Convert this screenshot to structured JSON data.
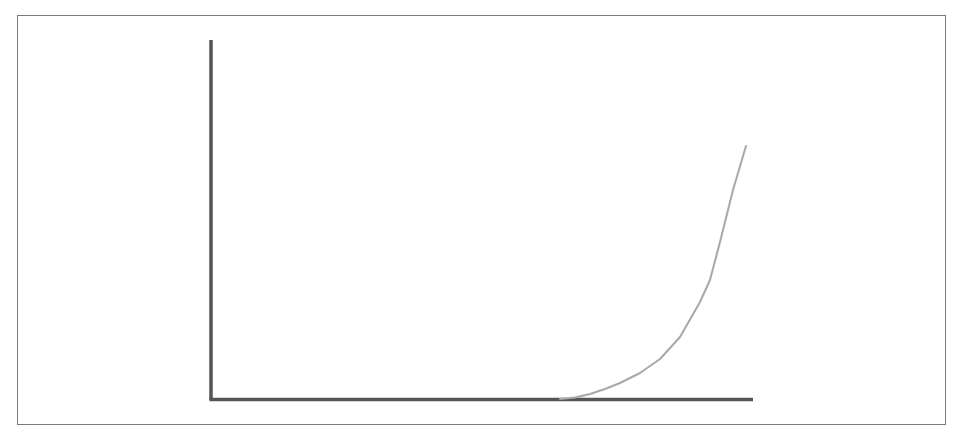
{
  "figure": {
    "colors": {
      "frame": "#7a7a7a",
      "axes": "#555555",
      "curve": "#a8a8a8",
      "background": "#ffffff"
    }
  },
  "axes": {
    "origin": [
      211,
      400
    ],
    "y_axis_top": [
      211,
      40
    ],
    "x_axis_end": [
      753,
      400
    ],
    "x_label": "",
    "y_label": "",
    "ticks": []
  },
  "curve": {
    "points": "560,399 575,397.5 590,394 605,389 620,383 640,373 660,359 680,337 700,302 710,280 720,242 733,190 746,146"
  }
}
